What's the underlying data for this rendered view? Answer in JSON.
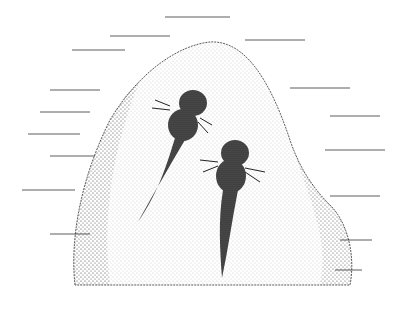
{
  "image": {
    "description": "Pen-and-ink stipple illustration of two gilled larvae resting on a rock underwater",
    "colors": {
      "ink": "#1a1a1a",
      "paper": "#ffffff"
    },
    "subjects": [
      "larva-left",
      "larva-right",
      "rock",
      "water-lines"
    ]
  }
}
